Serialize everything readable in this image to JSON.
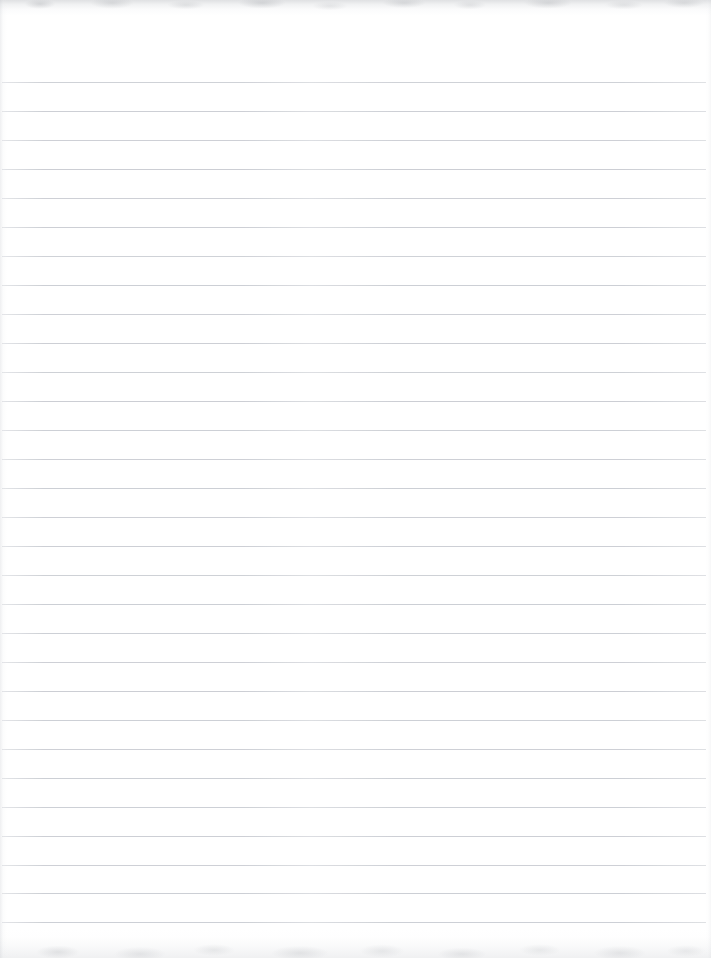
{
  "document": {
    "kind": "scanned-lined-notebook-page",
    "title": "",
    "page_text": "",
    "page_width": 711,
    "page_height": 958
  },
  "paper": {
    "background_color": "#ffffff",
    "rule_color": "#c9ccd2",
    "edge_shadow_color": "#b0b3b8",
    "rule_thickness_px": 1,
    "rule_spacing_px": 29,
    "first_rule_y": 82,
    "rule_inset_left_px": 2,
    "rule_inset_right_px": 5,
    "header_blank_height_px": 82,
    "footer_blank_height_px": 36,
    "rule_count": 30
  },
  "rules": [
    {
      "index": 1,
      "y": 82,
      "opacity": 0.88
    },
    {
      "index": 2,
      "y": 111,
      "opacity": 0.92
    },
    {
      "index": 3,
      "y": 140,
      "opacity": 0.9
    },
    {
      "index": 4,
      "y": 169,
      "opacity": 0.94
    },
    {
      "index": 5,
      "y": 198,
      "opacity": 0.9
    },
    {
      "index": 6,
      "y": 227,
      "opacity": 0.92
    },
    {
      "index": 7,
      "y": 256,
      "opacity": 0.88
    },
    {
      "index": 8,
      "y": 285,
      "opacity": 0.93
    },
    {
      "index": 9,
      "y": 314,
      "opacity": 0.9
    },
    {
      "index": 10,
      "y": 343,
      "opacity": 0.92
    },
    {
      "index": 11,
      "y": 372,
      "opacity": 0.89
    },
    {
      "index": 12,
      "y": 401,
      "opacity": 0.94
    },
    {
      "index": 13,
      "y": 430,
      "opacity": 0.91
    },
    {
      "index": 14,
      "y": 459,
      "opacity": 0.9
    },
    {
      "index": 15,
      "y": 488,
      "opacity": 0.93
    },
    {
      "index": 16,
      "y": 517,
      "opacity": 0.9
    },
    {
      "index": 17,
      "y": 546,
      "opacity": 0.92
    },
    {
      "index": 18,
      "y": 575,
      "opacity": 0.89
    },
    {
      "index": 19,
      "y": 604,
      "opacity": 0.93
    },
    {
      "index": 20,
      "y": 633,
      "opacity": 0.91
    },
    {
      "index": 21,
      "y": 662,
      "opacity": 0.9
    },
    {
      "index": 22,
      "y": 691,
      "opacity": 0.94
    },
    {
      "index": 23,
      "y": 720,
      "opacity": 0.91
    },
    {
      "index": 24,
      "y": 749,
      "opacity": 0.9
    },
    {
      "index": 25,
      "y": 778,
      "opacity": 0.93
    },
    {
      "index": 26,
      "y": 807,
      "opacity": 0.91
    },
    {
      "index": 27,
      "y": 836,
      "opacity": 0.92
    },
    {
      "index": 28,
      "y": 865,
      "opacity": 0.9
    },
    {
      "index": 29,
      "y": 893,
      "opacity": 0.93
    },
    {
      "index": 30,
      "y": 922,
      "opacity": 0.91
    }
  ]
}
